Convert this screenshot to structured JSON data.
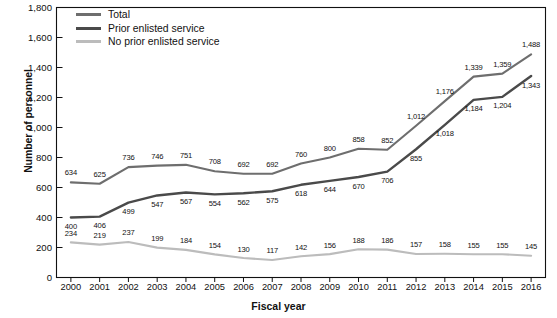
{
  "chart_data": {
    "type": "line",
    "title": "",
    "xlabel": "Fiscal year",
    "ylabel": "Number of personnel",
    "categories": [
      "2000",
      "2001",
      "2002",
      "2003",
      "2004",
      "2005",
      "2006",
      "2007",
      "2008",
      "2009",
      "2010",
      "2011",
      "2012",
      "2013",
      "2014",
      "2015",
      "2016"
    ],
    "ylim": [
      0,
      1800
    ],
    "yticks": [
      "0",
      "200",
      "400",
      "600",
      "800",
      "1,000",
      "1,200",
      "1,400",
      "1,600",
      "1,800"
    ],
    "ytick_values": [
      0,
      200,
      400,
      600,
      800,
      1000,
      1200,
      1400,
      1600,
      1800
    ],
    "grid": false,
    "legend_position": "top-left",
    "series": [
      {
        "name": "Total",
        "color": "#6e6e6e",
        "values": [
          634,
          625,
          736,
          746,
          751,
          708,
          692,
          692,
          760,
          800,
          858,
          852,
          1012,
          1176,
          1339,
          1359,
          1488
        ],
        "labels": [
          "634",
          "625",
          "736",
          "746",
          "751",
          "708",
          "692",
          "692",
          "760",
          "800",
          "858",
          "852",
          "1,012",
          "1,176",
          "1,339",
          "1,359",
          "1,488"
        ]
      },
      {
        "name": "Prior enlisted service",
        "color": "#4a4a4a",
        "values": [
          400,
          406,
          499,
          547,
          567,
          554,
          562,
          575,
          618,
          644,
          670,
          706,
          855,
          1018,
          1184,
          1204,
          1343
        ],
        "labels": [
          "400",
          "406",
          "499",
          "547",
          "567",
          "554",
          "562",
          "575",
          "618",
          "644",
          "670",
          "706",
          "855",
          "1,018",
          "1,184",
          "1,204",
          "1,343"
        ]
      },
      {
        "name": "No prior enlisted service",
        "color": "#bcbcbc",
        "values": [
          234,
          219,
          237,
          199,
          184,
          154,
          130,
          117,
          142,
          156,
          188,
          186,
          157,
          158,
          155,
          155,
          145
        ],
        "labels": [
          "234",
          "219",
          "237",
          "199",
          "184",
          "154",
          "130",
          "117",
          "142",
          "156",
          "188",
          "186",
          "157",
          "158",
          "155",
          "155",
          "145"
        ]
      }
    ]
  },
  "axis_color": "#111111",
  "background": "#ffffff"
}
